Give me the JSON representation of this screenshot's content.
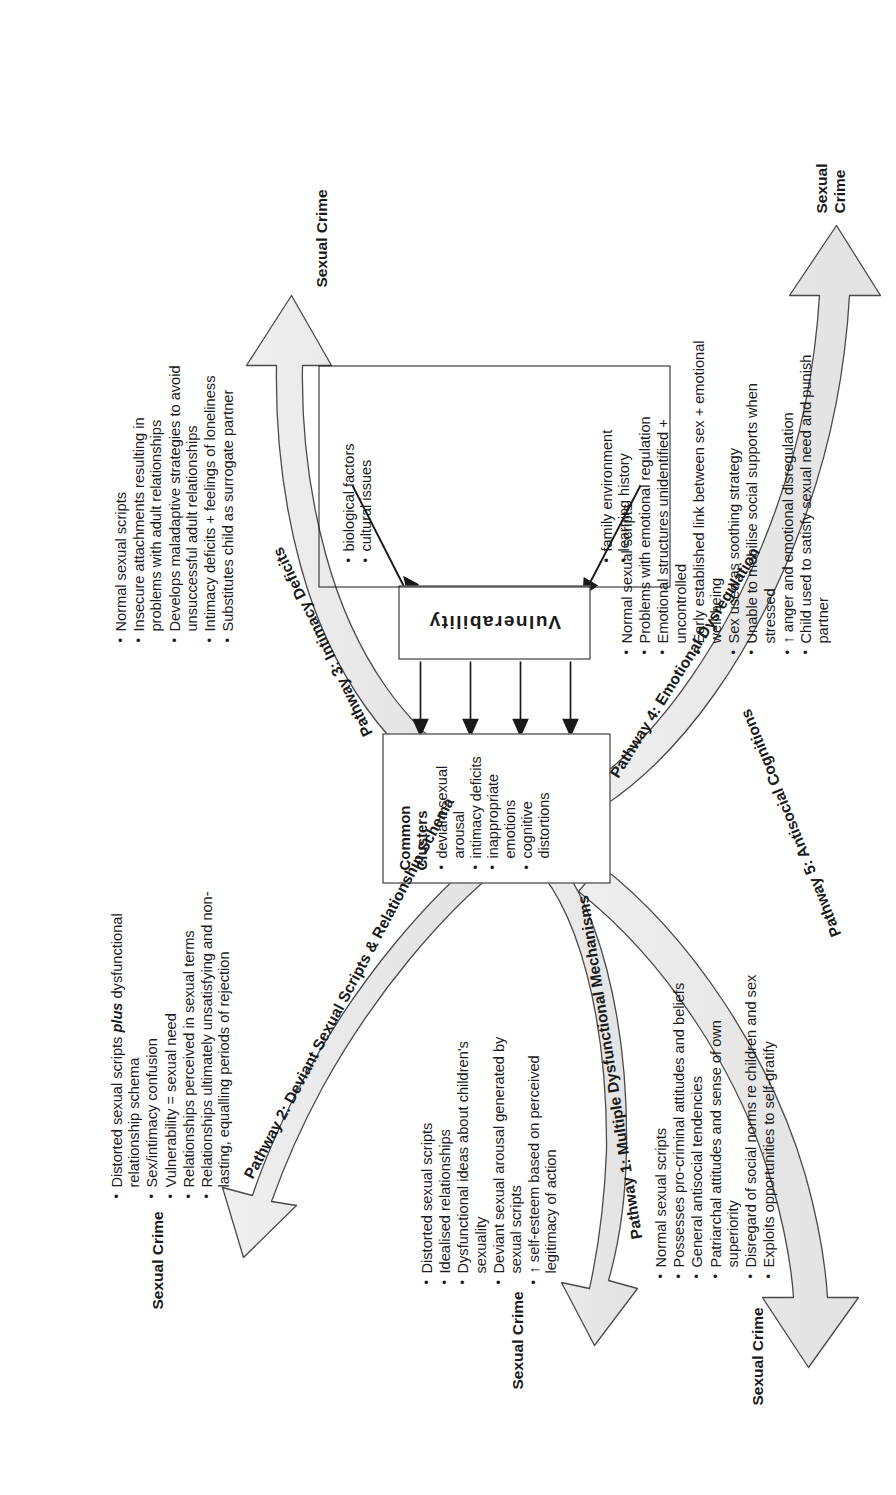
{
  "figure": {
    "type": "flow-diagram",
    "orientation": "rotated-90-ccw"
  },
  "vulnerability": {
    "label": "Vulnerability",
    "factors_left": [
      "family environment",
      "learning history"
    ],
    "factors_right": [
      "biological factors",
      "cultural issues"
    ]
  },
  "common_clusters": {
    "title": "Common Clusters",
    "items": [
      "deviant sexual arousal",
      "intimacy deficits",
      "inappropriate emotions",
      "cognitive distortions"
    ]
  },
  "outcome_label": "Sexual Crime",
  "outcome_label_wrapped_line1": "Sexual",
  "outcome_label_wrapped_line2": "Crime",
  "pathways": [
    {
      "id": "pathway-1",
      "label": "Pathway 1:  Multiple Dysfunctional Mechanisms",
      "items": [
        "Distorted sexual scripts",
        "Idealised relationships",
        "Dysfunctional ideas about children's sexuality",
        "Deviant sexual arousal generated by sexual scripts",
        "↑ self-esteem based on perceived legitimacy of action"
      ]
    },
    {
      "id": "pathway-2",
      "label": "Pathway 2:  Deviant Sexual Scripts & Relationship Schema",
      "items": [
        "Distorted sexual scripts plus dysfunctional relationship schema",
        "Sex/intimacy confusion",
        "Vulnerability = sexual need",
        "Relationships perceived in sexual terms",
        "Relationships ultimately unsatisfying and non-lasting, equalling periods of rejection"
      ],
      "item_0_pre": "Distorted sexual scripts ",
      "item_0_em": "plus",
      "item_0_post": " dysfunctional relationship schema"
    },
    {
      "id": "pathway-3",
      "label": "Pathway 3:  Intimacy Deficits",
      "items": [
        "Normal sexual scripts",
        "Insecure attachments resulting in problems with adult relationships",
        "Develops maladaptive strategies to avoid unsuccessful adult relationships",
        "Intimacy deficits + feelings of loneliness",
        "Substitutes child as surrogate partner"
      ]
    },
    {
      "id": "pathway-4",
      "label": "Pathway 4:  Emotional Dysregulation",
      "items": [
        "Normal sexual scripts",
        "Problems with emotional regulation",
        "Emotional structures unidentified + uncontrolled",
        "Early established link between sex + emotional well-being",
        "Sex used as soothing strategy",
        "Unable to mobilise social supports when stressed",
        "↑ anger and emotional disregulation",
        "Child used to satisfy sexual need and punish partner"
      ]
    },
    {
      "id": "pathway-5",
      "label": "Pathway 5:  Antisocial Cognitions",
      "items": [
        "Normal sexual scripts",
        "Possesses pro-criminal attitudes and beliefs",
        "General antisocial tendencies",
        "Patriarchal attitudes and sense of own superiority",
        "Disregard of social norms re children and sex",
        "Exploits opportunities to self-gratify"
      ]
    }
  ],
  "colors": {
    "stroke": "#1a1a1a",
    "arrow_fill": "#e8e8e8",
    "background": "#ffffff"
  }
}
